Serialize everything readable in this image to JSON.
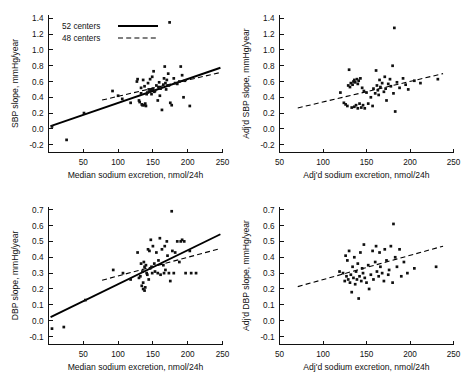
{
  "figure": {
    "title": "",
    "panel_count": 4
  },
  "legend": {
    "entries": [
      {
        "label": "52 centers",
        "style": "solid"
      },
      {
        "label": "48 centers",
        "style": "dashed"
      }
    ]
  },
  "chart_data": [
    {
      "id": "sbp-unadjusted",
      "position": "top-left",
      "type": "scatter",
      "title": "",
      "xlabel": "Median sodium excretion, nmol/24h",
      "ylabel": "SBP slope, mmHg/year",
      "xlim": [
        0,
        250
      ],
      "ylim": [
        -0.3,
        1.45
      ],
      "xticks": [
        50,
        100,
        150,
        200,
        250
      ],
      "yticks": [
        -0.2,
        0.0,
        0.2,
        0.4,
        0.6,
        0.8,
        1.0,
        1.2,
        1.4
      ],
      "xticklabels": [
        "50",
        "100",
        "150",
        "200",
        "250"
      ],
      "yticklabels": [
        "-0.2",
        "0.0",
        "0.2",
        "0.4",
        "0.6",
        "0.8",
        "1.0",
        "1.2",
        "1.4"
      ],
      "grid": false,
      "legend_position": "top-left",
      "points": [
        [
          5,
          0.03
        ],
        [
          26,
          -0.14
        ],
        [
          51,
          0.2
        ],
        [
          92,
          0.48
        ],
        [
          100,
          0.42
        ],
        [
          106,
          0.38
        ],
        [
          118,
          0.33
        ],
        [
          127,
          0.6
        ],
        [
          128,
          0.63
        ],
        [
          130,
          0.36
        ],
        [
          131,
          0.34
        ],
        [
          133,
          0.45
        ],
        [
          133,
          0.52
        ],
        [
          134,
          0.31
        ],
        [
          135,
          0.3
        ],
        [
          136,
          0.62
        ],
        [
          137,
          0.3
        ],
        [
          138,
          0.54
        ],
        [
          139,
          0.32
        ],
        [
          140,
          0.29
        ],
        [
          141,
          0.44
        ],
        [
          142,
          0.46
        ],
        [
          143,
          0.58
        ],
        [
          144,
          0.5
        ],
        [
          145,
          0.47
        ],
        [
          146,
          0.63
        ],
        [
          147,
          0.49
        ],
        [
          148,
          0.44
        ],
        [
          149,
          0.66
        ],
        [
          150,
          0.51
        ],
        [
          151,
          0.73
        ],
        [
          152,
          0.47
        ],
        [
          153,
          0.48
        ],
        [
          155,
          0.55
        ],
        [
          157,
          0.36
        ],
        [
          158,
          0.53
        ],
        [
          159,
          0.59
        ],
        [
          160,
          0.42
        ],
        [
          161,
          0.51
        ],
        [
          163,
          0.24
        ],
        [
          165,
          0.56
        ],
        [
          166,
          0.64
        ],
        [
          167,
          0.79
        ],
        [
          168,
          0.58
        ],
        [
          169,
          0.5
        ],
        [
          170,
          0.62
        ],
        [
          172,
          0.7
        ],
        [
          173,
          0.55
        ],
        [
          174,
          1.35
        ],
        [
          175,
          0.33
        ],
        [
          177,
          0.3
        ],
        [
          180,
          0.64
        ],
        [
          182,
          0.58
        ],
        [
          185,
          0.57
        ],
        [
          188,
          0.6
        ],
        [
          190,
          0.79
        ],
        [
          192,
          0.68
        ],
        [
          194,
          0.4
        ],
        [
          196,
          0.61
        ],
        [
          203,
          0.29
        ]
      ],
      "fit_lines": [
        {
          "name": "52 centers",
          "style": "solid",
          "x_start": 3,
          "y_start": 0.035,
          "x_end": 247,
          "y_end": 0.775
        },
        {
          "name": "48 centers",
          "style": "dashed",
          "x_start": 77,
          "y_start": 0.365,
          "x_end": 247,
          "y_end": 0.715
        }
      ]
    },
    {
      "id": "sbp-adjusted",
      "position": "top-right",
      "type": "scatter",
      "title": "",
      "xlabel": "Adj'd sodium excretion, nmol/24h",
      "ylabel": "Adj'd SBP slope, mmHg/year",
      "xlim": [
        50,
        250
      ],
      "ylim": [
        -0.3,
        1.45
      ],
      "xticks": [
        50,
        100,
        150,
        200,
        250
      ],
      "yticks": [
        -0.2,
        0.0,
        0.2,
        0.4,
        0.6,
        0.8,
        1.0,
        1.2,
        1.4
      ],
      "xticklabels": [
        "50",
        "100",
        "150",
        "200",
        "250"
      ],
      "yticklabels": [
        "-0.2",
        "0.0",
        "0.2",
        "0.4",
        "0.6",
        "0.8",
        "1.0",
        "1.2",
        "1.4"
      ],
      "grid": false,
      "legend_position": "none",
      "points": [
        [
          120,
          0.46
        ],
        [
          124,
          0.33
        ],
        [
          126,
          0.31
        ],
        [
          128,
          0.29
        ],
        [
          129,
          0.55
        ],
        [
          130,
          0.75
        ],
        [
          131,
          0.53
        ],
        [
          132,
          0.58
        ],
        [
          133,
          0.27
        ],
        [
          134,
          0.56
        ],
        [
          135,
          0.6
        ],
        [
          136,
          0.62
        ],
        [
          136,
          0.28
        ],
        [
          137,
          0.59
        ],
        [
          138,
          0.3
        ],
        [
          139,
          0.63
        ],
        [
          140,
          0.26
        ],
        [
          140,
          0.57
        ],
        [
          141,
          0.61
        ],
        [
          142,
          0.32
        ],
        [
          143,
          0.64
        ],
        [
          144,
          0.27
        ],
        [
          145,
          0.52
        ],
        [
          146,
          0.3
        ],
        [
          147,
          0.48
        ],
        [
          148,
          0.26
        ],
        [
          150,
          0.46
        ],
        [
          152,
          0.32
        ],
        [
          155,
          0.4
        ],
        [
          157,
          0.29
        ],
        [
          158,
          0.51
        ],
        [
          160,
          0.45
        ],
        [
          161,
          0.74
        ],
        [
          162,
          0.55
        ],
        [
          163,
          0.49
        ],
        [
          164,
          0.43
        ],
        [
          165,
          0.62
        ],
        [
          166,
          0.53
        ],
        [
          168,
          0.58
        ],
        [
          170,
          0.47
        ],
        [
          171,
          0.66
        ],
        [
          172,
          0.51
        ],
        [
          173,
          0.36
        ],
        [
          175,
          0.57
        ],
        [
          177,
          0.63
        ],
        [
          178,
          0.54
        ],
        [
          180,
          0.8
        ],
        [
          181,
          0.45
        ],
        [
          182,
          1.28
        ],
        [
          183,
          0.22
        ],
        [
          185,
          0.59
        ],
        [
          188,
          0.52
        ],
        [
          192,
          0.64
        ],
        [
          195,
          0.56
        ],
        [
          198,
          0.5
        ],
        [
          205,
          0.61
        ],
        [
          212,
          0.58
        ],
        [
          232,
          0.63
        ]
      ],
      "fit_lines": [
        {
          "name": "48 centers",
          "style": "dashed",
          "x_start": 71,
          "y_start": 0.265,
          "x_end": 238,
          "y_end": 0.7
        }
      ]
    },
    {
      "id": "dbp-unadjusted",
      "position": "bottom-left",
      "type": "scatter",
      "title": "",
      "xlabel": "Median sodium excretion, nmol/24h",
      "ylabel": "DBP slope, mmHg/year",
      "xlim": [
        0,
        250
      ],
      "ylim": [
        -0.15,
        0.72
      ],
      "xticks": [
        50,
        100,
        150,
        200,
        250
      ],
      "yticks": [
        -0.1,
        0.0,
        0.1,
        0.2,
        0.3,
        0.4,
        0.5,
        0.6,
        0.7
      ],
      "xticklabels": [
        "50",
        "100",
        "150",
        "200",
        "250"
      ],
      "yticklabels": [
        "-0.1",
        "0.0",
        "0.1",
        "0.2",
        "0.3",
        "0.4",
        "0.5",
        "0.6",
        "0.7"
      ],
      "grid": false,
      "legend_position": "none",
      "points": [
        [
          5,
          -0.05
        ],
        [
          22,
          -0.04
        ],
        [
          53,
          0.13
        ],
        [
          93,
          0.32
        ],
        [
          107,
          0.3
        ],
        [
          118,
          0.26
        ],
        [
          128,
          0.43
        ],
        [
          130,
          0.27
        ],
        [
          132,
          0.28
        ],
        [
          133,
          0.36
        ],
        [
          134,
          0.22
        ],
        [
          135,
          0.31
        ],
        [
          136,
          0.2
        ],
        [
          136,
          0.24
        ],
        [
          137,
          0.37
        ],
        [
          138,
          0.19
        ],
        [
          138,
          0.34
        ],
        [
          139,
          0.21
        ],
        [
          140,
          0.35
        ],
        [
          141,
          0.3
        ],
        [
          142,
          0.29
        ],
        [
          143,
          0.45
        ],
        [
          144,
          0.26
        ],
        [
          145,
          0.44
        ],
        [
          146,
          0.33
        ],
        [
          147,
          0.51
        ],
        [
          148,
          0.34
        ],
        [
          149,
          0.3
        ],
        [
          150,
          0.47
        ],
        [
          152,
          0.36
        ],
        [
          153,
          0.31
        ],
        [
          155,
          0.43
        ],
        [
          157,
          0.3
        ],
        [
          158,
          0.38
        ],
        [
          160,
          0.52
        ],
        [
          161,
          0.29
        ],
        [
          163,
          0.45
        ],
        [
          165,
          0.35
        ],
        [
          166,
          0.3
        ],
        [
          167,
          0.47
        ],
        [
          168,
          0.32
        ],
        [
          170,
          0.5
        ],
        [
          171,
          0.41
        ],
        [
          173,
          0.3
        ],
        [
          175,
          0.25
        ],
        [
          177,
          0.69
        ],
        [
          178,
          0.44
        ],
        [
          180,
          0.3
        ],
        [
          182,
          0.43
        ],
        [
          185,
          0.5
        ],
        [
          188,
          0.37
        ],
        [
          190,
          0.5
        ],
        [
          192,
          0.51
        ],
        [
          195,
          0.5
        ],
        [
          197,
          0.3
        ],
        [
          203,
          0.44
        ],
        [
          205,
          0.3
        ],
        [
          212,
          0.3
        ]
      ],
      "fit_lines": [
        {
          "name": "52 centers",
          "style": "solid",
          "x_start": 3,
          "y_start": 0.022,
          "x_end": 247,
          "y_end": 0.545
        },
        {
          "name": "48 centers",
          "style": "dashed",
          "x_start": 77,
          "y_start": 0.255,
          "x_end": 247,
          "y_end": 0.455
        }
      ]
    },
    {
      "id": "dbp-adjusted",
      "position": "bottom-right",
      "type": "scatter",
      "title": "",
      "xlabel": "Adj'd sodium excretion, nmol/24h",
      "ylabel": "Adj'd DBP slope, mmHg/year",
      "xlim": [
        50,
        250
      ],
      "ylim": [
        -0.15,
        0.72
      ],
      "xticks": [
        50,
        100,
        150,
        200,
        250
      ],
      "yticks": [
        -0.1,
        0.0,
        0.1,
        0.2,
        0.3,
        0.4,
        0.5,
        0.6,
        0.7
      ],
      "xticklabels": [
        "50",
        "100",
        "150",
        "200",
        "250"
      ],
      "yticklabels": [
        "-0.1",
        "0.0",
        "0.1",
        "0.2",
        "0.3",
        "0.4",
        "0.5",
        "0.6",
        "0.7"
      ],
      "grid": false,
      "legend_position": "none",
      "points": [
        [
          119,
          0.31
        ],
        [
          123,
          0.3
        ],
        [
          125,
          0.25
        ],
        [
          126,
          0.41
        ],
        [
          127,
          0.28
        ],
        [
          128,
          0.38
        ],
        [
          129,
          0.26
        ],
        [
          130,
          0.44
        ],
        [
          131,
          0.24
        ],
        [
          132,
          0.29
        ],
        [
          133,
          0.18
        ],
        [
          134,
          0.34
        ],
        [
          135,
          0.27
        ],
        [
          136,
          0.4
        ],
        [
          137,
          0.23
        ],
        [
          138,
          0.31
        ],
        [
          139,
          0.26
        ],
        [
          140,
          0.36
        ],
        [
          141,
          0.14
        ],
        [
          142,
          0.28
        ],
        [
          143,
          0.43
        ],
        [
          144,
          0.25
        ],
        [
          145,
          0.33
        ],
        [
          146,
          0.3
        ],
        [
          147,
          0.48
        ],
        [
          148,
          0.27
        ],
        [
          150,
          0.24
        ],
        [
          152,
          0.35
        ],
        [
          153,
          0.2
        ],
        [
          155,
          0.29
        ],
        [
          157,
          0.44
        ],
        [
          158,
          0.26
        ],
        [
          160,
          0.37
        ],
        [
          161,
          0.47
        ],
        [
          162,
          0.31
        ],
        [
          164,
          0.28
        ],
        [
          165,
          0.43
        ],
        [
          166,
          0.34
        ],
        [
          168,
          0.3
        ],
        [
          170,
          0.25
        ],
        [
          171,
          0.45
        ],
        [
          173,
          0.38
        ],
        [
          175,
          0.29
        ],
        [
          176,
          0.32
        ],
        [
          178,
          0.47
        ],
        [
          180,
          0.24
        ],
        [
          181,
          0.61
        ],
        [
          183,
          0.4
        ],
        [
          185,
          0.34
        ],
        [
          188,
          0.45
        ],
        [
          190,
          0.28
        ],
        [
          193,
          0.37
        ],
        [
          197,
          0.3
        ],
        [
          205,
          0.33
        ],
        [
          230,
          0.34
        ]
      ],
      "fit_lines": [
        {
          "name": "48 centers",
          "style": "dashed",
          "x_start": 71,
          "y_start": 0.215,
          "x_end": 238,
          "y_end": 0.47
        }
      ]
    }
  ]
}
